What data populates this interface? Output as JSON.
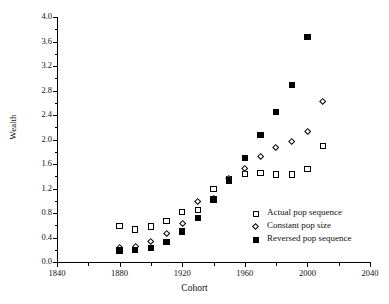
{
  "chart_data": {
    "type": "scatter",
    "title": "",
    "xlabel": "Cohort",
    "ylabel": "Wealth",
    "xlim": [
      1840,
      2040
    ],
    "ylim": [
      0.0,
      4.0
    ],
    "xticks": [
      1840,
      1880,
      1920,
      1960,
      2000,
      2040
    ],
    "xtick_labels": [
      "1840",
      "1880",
      "1920",
      "1960",
      "2000",
      "2040"
    ],
    "x_minor_step": 20,
    "yticks": [
      0.0,
      0.4,
      0.8,
      1.2,
      1.6,
      2.0,
      2.4,
      2.8,
      3.2,
      3.6,
      4.0
    ],
    "ytick_labels": [
      "0.0",
      "0.4",
      "0.8",
      "1.2",
      "1.6",
      "2.0",
      "2.4",
      "2.8",
      "3.2",
      "3.6",
      "4.0"
    ],
    "y_minor_step": 0.2,
    "grid": false,
    "legend_position": "center-right",
    "series": [
      {
        "name": "Actual pop sequence",
        "marker": "open-square",
        "color": "#000000",
        "x": [
          1880,
          1890,
          1900,
          1910,
          1920,
          1930,
          1940,
          1950,
          1960,
          1970,
          1980,
          1990,
          2000,
          2010
        ],
        "values": [
          0.59,
          0.53,
          0.58,
          0.67,
          0.82,
          0.85,
          1.19,
          1.35,
          1.44,
          1.45,
          1.43,
          1.43,
          1.52,
          1.89
        ]
      },
      {
        "name": "Constant pop size",
        "marker": "open-diamond",
        "color": "#000000",
        "x": [
          1880,
          1890,
          1900,
          1910,
          1920,
          1930,
          1940,
          1950,
          1960,
          1970,
          1980,
          1990,
          2000,
          2010
        ],
        "values": [
          0.24,
          0.25,
          0.33,
          0.47,
          0.63,
          0.99,
          1.04,
          1.36,
          1.52,
          1.72,
          1.86,
          1.97,
          2.13,
          2.61
        ]
      },
      {
        "name": "Reversed pop sequence",
        "marker": "filled-square",
        "color": "#000000",
        "x": [
          1880,
          1890,
          1900,
          1910,
          1920,
          1930,
          1940,
          1950,
          1960,
          1970,
          1980,
          1990,
          2000
        ],
        "values": [
          0.19,
          0.2,
          0.23,
          0.33,
          0.5,
          0.72,
          1.02,
          1.33,
          1.7,
          2.07,
          2.45,
          2.89,
          3.67
        ]
      }
    ]
  },
  "legend": {
    "items": [
      {
        "label": "Actual pop sequence",
        "marker": "open-square"
      },
      {
        "label": "Constant pop size",
        "marker": "open-diamond"
      },
      {
        "label": "Reversed pop sequence",
        "marker": "filled-square"
      }
    ]
  }
}
